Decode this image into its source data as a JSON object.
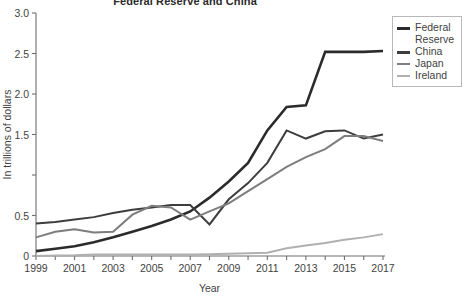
{
  "chart_data": {
    "type": "line",
    "title": "Federal Reserve and China",
    "xlabel": "Year",
    "ylabel": "In trillions of dollars",
    "xlim": [
      1999,
      2017
    ],
    "ylim": [
      0,
      3.0
    ],
    "grid": false,
    "legend_position": "right",
    "x": [
      1999,
      2000,
      2001,
      2002,
      2003,
      2004,
      2005,
      2006,
      2007,
      2008,
      2009,
      2010,
      2011,
      2012,
      2013,
      2014,
      2015,
      2016,
      2017
    ],
    "xtick_labels": [
      "1999",
      "2001",
      "2003",
      "2005",
      "2007",
      "2009",
      "2011",
      "2013",
      "2015",
      "2017"
    ],
    "ytick_labels": [
      "0",
      "0.5",
      "1.5",
      "2.0",
      "2.5",
      "3.0"
    ],
    "ytick_values": [
      0,
      0.5,
      1.0,
      1.5,
      2.0,
      2.5,
      3.0
    ],
    "series": [
      {
        "name": "Federal Reserve",
        "color": "#2b2b2b",
        "width": 2.6,
        "values": [
          0.06,
          0.09,
          0.12,
          0.17,
          0.23,
          0.3,
          0.37,
          0.45,
          0.55,
          0.72,
          0.92,
          1.15,
          1.55,
          1.84,
          1.86,
          2.52,
          2.52,
          2.52,
          2.53
        ]
      },
      {
        "name": "China",
        "color": "#3d3d3d",
        "width": 2.0,
        "values": [
          0.4,
          0.42,
          0.45,
          0.48,
          0.53,
          0.57,
          0.6,
          0.63,
          0.63,
          0.39,
          0.7,
          0.9,
          1.15,
          1.55,
          1.45,
          1.54,
          1.55,
          1.45,
          1.5
        ]
      },
      {
        "name": "Japan",
        "color": "#7d7d7d",
        "width": 2.0,
        "values": [
          0.23,
          0.3,
          0.33,
          0.29,
          0.3,
          0.51,
          0.62,
          0.6,
          0.45,
          0.55,
          0.65,
          0.8,
          0.95,
          1.1,
          1.22,
          1.32,
          1.48,
          1.48,
          1.42
        ]
      },
      {
        "name": "Ireland",
        "color": "#b0b0b0",
        "width": 2.0,
        "values": [
          0.0,
          0.005,
          0.008,
          0.018,
          0.02,
          0.02,
          0.02,
          0.02,
          0.02,
          0.022,
          0.028,
          0.035,
          0.04,
          0.095,
          0.13,
          0.16,
          0.2,
          0.23,
          0.27
        ]
      }
    ]
  },
  "legend": {
    "entries": [
      {
        "label": "Federal Reserve",
        "color": "#2b2b2b"
      },
      {
        "label": "China",
        "color": "#3d3d3d"
      },
      {
        "label": "Japan",
        "color": "#7d7d7d"
      },
      {
        "label": "Ireland",
        "color": "#b0b0b0"
      }
    ]
  }
}
